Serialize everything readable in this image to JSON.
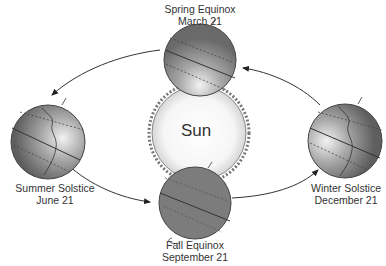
{
  "diagram": {
    "title": "",
    "center": {
      "label": "Sun"
    },
    "positions": [
      {
        "id": "spring",
        "title": "Spring Equinox",
        "date": "March 21"
      },
      {
        "id": "summer",
        "title": "Summer Solstice",
        "date": "June 21"
      },
      {
        "id": "fall",
        "title": "Fall Equinox",
        "date": "September 21"
      },
      {
        "id": "winter",
        "title": "Winter Solstice",
        "date": "December 21"
      }
    ],
    "colors": {
      "earth": "#7a7a7a",
      "sun": "#f4f4f4",
      "line": "#333333",
      "text": "#333333"
    }
  }
}
